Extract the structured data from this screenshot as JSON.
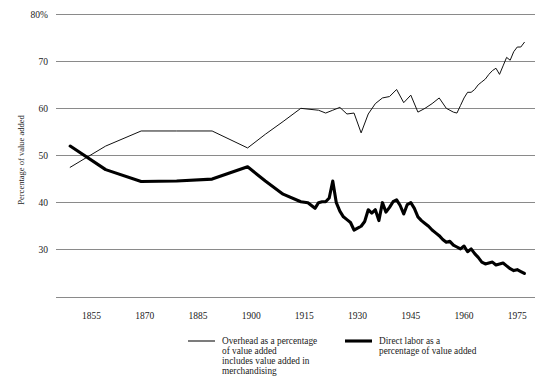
{
  "chart_data": {
    "type": "line",
    "title": "",
    "xlabel": "",
    "ylabel": "Percentage of value added",
    "xlim": [
      1845,
      1980
    ],
    "ylim": [
      18,
      80
    ],
    "grid": true,
    "gridlines_y": [
      80,
      70,
      60,
      50,
      40,
      30,
      20
    ],
    "ytick_labels": [
      "80%",
      "70",
      "60",
      "50",
      "40",
      "30"
    ],
    "ytick_values": [
      80,
      70,
      60,
      50,
      40,
      30
    ],
    "xtick_labels": [
      "1855",
      "1870",
      "1885",
      "1900",
      "1915",
      "1930",
      "1945",
      "1960",
      "1975"
    ],
    "xtick_values": [
      1855,
      1870,
      1885,
      1900,
      1915,
      1930,
      1945,
      1960,
      1975
    ],
    "legend_position": "below-axis",
    "series": [
      {
        "name": "Overhead as a percentage of value added includes value added in merchandising",
        "style": "thin",
        "color": "#111111",
        "x": [
          1849,
          1859,
          1869,
          1879,
          1889,
          1899,
          1904,
          1909,
          1914,
          1919,
          1921,
          1923,
          1925,
          1927,
          1929,
          1931,
          1933,
          1935,
          1937,
          1939,
          1941,
          1943,
          1945,
          1947,
          1949,
          1951,
          1953,
          1955,
          1957,
          1958,
          1959,
          1960,
          1961,
          1962,
          1963,
          1964,
          1965,
          1966,
          1967,
          1968,
          1969,
          1970,
          1971,
          1972,
          1973,
          1974,
          1975,
          1976,
          1977
        ],
        "y": [
          47.5,
          52.0,
          55.2,
          55.2,
          55.2,
          51.6,
          54.5,
          57.2,
          60.0,
          59.6,
          59.0,
          59.6,
          60.2,
          58.8,
          59.0,
          54.8,
          58.8,
          61.0,
          62.2,
          62.5,
          64.0,
          61.2,
          62.8,
          59.2,
          60.0,
          61.0,
          62.2,
          60.0,
          59.2,
          59.0,
          60.6,
          62.2,
          63.4,
          63.4,
          64.0,
          65.0,
          65.6,
          66.2,
          67.2,
          68.0,
          68.5,
          67.2,
          69.0,
          70.8,
          70.2,
          72.0,
          73.0,
          73.0,
          74.0
        ]
      },
      {
        "name": "Direct labor as a percentage of value added",
        "style": "bold",
        "color": "#000000",
        "x": [
          1849,
          1859,
          1869,
          1879,
          1889,
          1899,
          1904,
          1909,
          1914,
          1916,
          1918,
          1919,
          1920,
          1921,
          1922,
          1923,
          1924,
          1925,
          1926,
          1927,
          1928,
          1929,
          1930,
          1931,
          1932,
          1933,
          1934,
          1935,
          1936,
          1937,
          1938,
          1939,
          1940,
          1941,
          1942,
          1943,
          1944,
          1945,
          1946,
          1947,
          1948,
          1949,
          1950,
          1951,
          1952,
          1953,
          1954,
          1955,
          1956,
          1957,
          1958,
          1959,
          1960,
          1961,
          1962,
          1963,
          1964,
          1965,
          1966,
          1967,
          1968,
          1969,
          1970,
          1971,
          1972,
          1973,
          1974,
          1975,
          1976,
          1977
        ],
        "y": [
          52.0,
          47.0,
          44.5,
          44.6,
          45.0,
          47.6,
          44.6,
          41.8,
          40.2,
          40.0,
          38.8,
          40.0,
          40.2,
          40.2,
          41.0,
          44.6,
          40.0,
          38.2,
          37.0,
          36.4,
          35.8,
          34.2,
          34.6,
          35.0,
          36.0,
          38.5,
          37.8,
          38.5,
          36.2,
          40.0,
          38.0,
          39.0,
          40.2,
          40.6,
          39.4,
          37.6,
          39.6,
          40.0,
          38.8,
          37.0,
          36.2,
          35.6,
          35.0,
          34.2,
          33.6,
          33.0,
          32.2,
          31.6,
          31.8,
          31.0,
          30.6,
          30.2,
          30.8,
          29.6,
          30.2,
          29.2,
          28.4,
          27.4,
          27.0,
          27.2,
          27.4,
          26.8,
          27.0,
          27.2,
          26.6,
          26.0,
          25.6,
          25.8,
          25.4,
          25.0
        ]
      }
    ]
  },
  "legend": {
    "entries": [
      {
        "line1": "Overhead as a percentage",
        "line2": "of value added",
        "line3": "includes value added in",
        "line4": "merchandising",
        "swatch": "thin-line-swatch"
      },
      {
        "line1": "Direct labor as a",
        "line2": "percentage of value added",
        "swatch": "bold-line-swatch"
      }
    ]
  },
  "axes": {
    "y_axis_title": "Percentage of value added",
    "y_ticks": [
      "80%",
      "70",
      "60",
      "50",
      "40",
      "30"
    ],
    "x_ticks": [
      "1855",
      "1870",
      "1885",
      "1900",
      "1915",
      "1930",
      "1945",
      "1960",
      "1975"
    ]
  },
  "colors": {
    "grid": "#8a8a8a",
    "thin_series": "#111111",
    "bold_series": "#000000",
    "background": "#ffffff",
    "text": "#1a1a1a"
  }
}
